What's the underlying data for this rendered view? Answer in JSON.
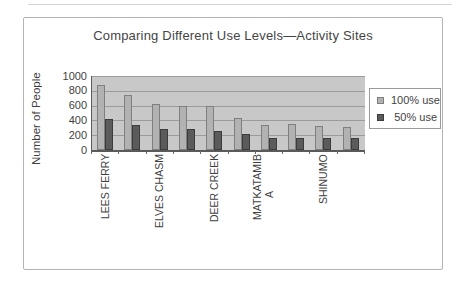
{
  "chart": {
    "title": "Comparing Different Use Levels—Activity Sites",
    "y_axis_title": "Number of People",
    "legend": [
      {
        "label": "100% use",
        "color": "#b2b2b2",
        "border": "#7f7f7f"
      },
      {
        "label": "50% use",
        "color": "#5b5b5b",
        "border": "#3c3c3c"
      }
    ],
    "colors": {
      "plot_background": "#c8c8c8",
      "gridline": "#9b9b9b",
      "series_100": "#b2b2b2",
      "series_100_border": "#7f7f7f",
      "series_50": "#5b5b5b",
      "series_50_border": "#3c3c3c",
      "axis": "#5a5a5a",
      "frame_border": "#b3b3b3",
      "text": "#3f3f3f"
    }
  },
  "chart_data": {
    "type": "bar",
    "title": "Comparing Different Use Levels—Activity Sites",
    "xlabel": "",
    "ylabel": "Number of People",
    "ylim": [
      0,
      1000
    ],
    "yticks": [
      0,
      200,
      400,
      600,
      800,
      1000
    ],
    "grid": true,
    "legend_position": "right",
    "x_label_rotation": 90,
    "categories": [
      "LEES FERRY",
      "",
      "ELVES CHASM",
      "",
      "DEER CREEK",
      "",
      "MATKATAMIBA",
      "",
      "SHINUMO",
      ""
    ],
    "categories_display_lines": [
      [
        "LEES FERRY"
      ],
      [],
      [
        "ELVES CHASM"
      ],
      [],
      [
        "DEER CREEK"
      ],
      [],
      [
        "MATKATAMIB",
        "A"
      ],
      [],
      [
        "SHINUMO"
      ],
      []
    ],
    "series": [
      {
        "name": "100% use",
        "values": [
          880,
          750,
          620,
          600,
          590,
          430,
          340,
          350,
          330,
          310
        ]
      },
      {
        "name": "50% use",
        "values": [
          420,
          340,
          290,
          280,
          260,
          210,
          160,
          160,
          165,
          160
        ]
      }
    ]
  }
}
